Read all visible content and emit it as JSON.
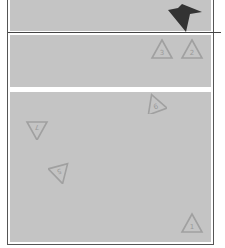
{
  "board": {
    "colors": {
      "panel": "#c4c4c4",
      "triangle_stroke": "#a0a0a0",
      "arrow": "#333333"
    },
    "arrow": {
      "icon": "down-arrow-icon",
      "x": 168,
      "y": 4
    },
    "tray_pieces": [
      {
        "label": "3",
        "x": 150,
        "y": 38,
        "rot": 0
      },
      {
        "label": "2",
        "x": 180,
        "y": 38,
        "rot": 0
      }
    ],
    "board_pieces": [
      {
        "label": "6",
        "x": 143,
        "y": 92,
        "rot": -20
      },
      {
        "label": "7",
        "x": 25,
        "y": 118,
        "rot": 180
      },
      {
        "label": "5",
        "x": 48,
        "y": 162,
        "rot": 165
      },
      {
        "label": "1",
        "x": 180,
        "y": 212,
        "rot": 0
      }
    ]
  }
}
